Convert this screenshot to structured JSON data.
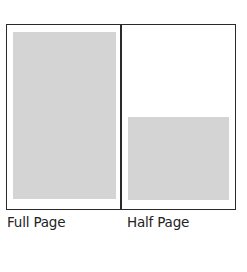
{
  "diagram": {
    "panels": [
      {
        "label": "Full Page",
        "ad_fill": "#d4d4d4"
      },
      {
        "label": "Half Page",
        "ad_fill": "#d4d4d4"
      }
    ],
    "border_color": "#2a2a2a"
  }
}
